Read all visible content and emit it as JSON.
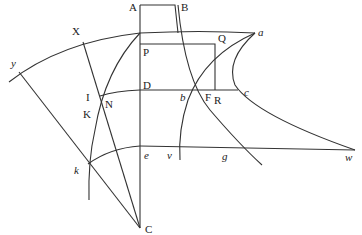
{
  "diagram": {
    "stroke_color": "#333333",
    "background": "#ffffff",
    "labels": {
      "A": "A",
      "B": "B",
      "X": "X",
      "P": "P",
      "Q": "Q",
      "a": "a",
      "y": "y",
      "I": "I",
      "N": "N",
      "D": "D",
      "b": "b",
      "F": "F",
      "R": "R",
      "c": "c",
      "K": "K",
      "e": "e",
      "v": "v",
      "g": "g",
      "w": "w",
      "k": "k",
      "C": "C"
    }
  }
}
